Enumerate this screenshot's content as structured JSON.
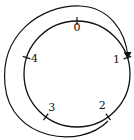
{
  "diagram": {
    "type": "cycle-diagram",
    "points": [
      {
        "label": "0",
        "angle_deg": 90
      },
      {
        "label": "1",
        "angle_deg": 18
      },
      {
        "label": "2",
        "angle_deg": -54
      },
      {
        "label": "3",
        "angle_deg": -126
      },
      {
        "label": "4",
        "angle_deg": 162
      }
    ],
    "arrow": {
      "from": "2",
      "to": "1",
      "direction": "clockwise-visual-around-left"
    },
    "stroke_color": "#111111",
    "background_color": "#ffffff"
  }
}
